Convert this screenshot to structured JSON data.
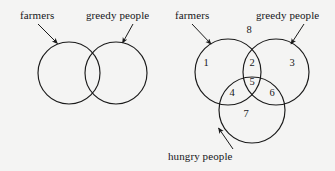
{
  "figure": {
    "background_color": "#f4f4f3",
    "stroke_color": "#1a1a1a",
    "text_color": "#16161a",
    "left_diagram": {
      "name": "two-set-venn-diagram",
      "labels": [
        {
          "id": "farmers",
          "text": "farmers",
          "x": 20,
          "y": 10
        },
        {
          "id": "greedy-people",
          "text": "greedy people",
          "x": 86,
          "y": 10
        }
      ],
      "sets": [
        {
          "id": "farmers-circle",
          "cx": 69,
          "cy": 73,
          "r": 31
        },
        {
          "id": "greedy-people-circle",
          "cx": 116,
          "cy": 73,
          "r": 31
        }
      ],
      "arrows": [
        {
          "id": "farmers-arrow",
          "from_x": 38,
          "from_y": 24,
          "to_x": 57,
          "to_y": 44
        },
        {
          "id": "greedy-people-arrow",
          "from_x": 132,
          "from_y": 24,
          "to_x": 122,
          "to_y": 44
        }
      ]
    },
    "right_diagram": {
      "name": "three-set-venn-diagram",
      "labels": [
        {
          "id": "farmers",
          "text": "farmers",
          "x": 175,
          "y": 10
        },
        {
          "id": "greedy-people",
          "text": "greedy people",
          "x": 256,
          "y": 10
        },
        {
          "id": "hungry-people",
          "text": "hungry people",
          "x": 168,
          "y": 151
        }
      ],
      "sets": [
        {
          "id": "farmers-circle",
          "cx": 228,
          "cy": 72,
          "r": 33
        },
        {
          "id": "greedy-people-circle",
          "cx": 276,
          "cy": 72,
          "r": 33
        },
        {
          "id": "hungry-people-circle",
          "cx": 252,
          "cy": 110,
          "r": 33
        }
      ],
      "arrows": [
        {
          "id": "farmers-arrow",
          "from_x": 192,
          "from_y": 24,
          "to_x": 211,
          "to_y": 45
        },
        {
          "id": "greedy-people-arrow",
          "from_x": 303,
          "from_y": 24,
          "to_x": 290,
          "to_y": 45
        },
        {
          "id": "hungry-people-arrow",
          "from_x": 232,
          "from_y": 148,
          "to_x": 217,
          "to_y": 127
        }
      ],
      "regions": [
        {
          "id": "region-1",
          "label": "1",
          "x": 206,
          "y": 62,
          "meaning": "farmers only"
        },
        {
          "id": "region-2",
          "label": "2",
          "x": 252,
          "y": 62,
          "meaning": "farmers and greedy people"
        },
        {
          "id": "region-3",
          "label": "3",
          "x": 292,
          "y": 62,
          "meaning": "greedy people only"
        },
        {
          "id": "region-4",
          "label": "4",
          "x": 232,
          "y": 92,
          "meaning": "farmers and hungry people"
        },
        {
          "id": "region-5",
          "label": "5",
          "x": 252,
          "y": 81,
          "meaning": "farmers, greedy people and hungry people"
        },
        {
          "id": "region-6",
          "label": "6",
          "x": 272,
          "y": 92,
          "meaning": "greedy people and hungry people"
        },
        {
          "id": "region-7",
          "label": "7",
          "x": 246,
          "y": 113,
          "meaning": "hungry people only"
        },
        {
          "id": "region-8",
          "label": "8",
          "x": 249,
          "y": 29,
          "meaning": "outside all sets"
        }
      ]
    }
  }
}
